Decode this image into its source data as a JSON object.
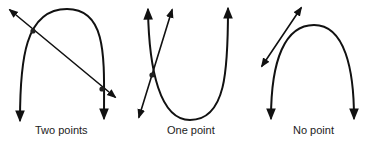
{
  "diagram": {
    "title": "",
    "panels": [
      {
        "id": "two",
        "label": "Two points",
        "intersections": 2
      },
      {
        "id": "one",
        "label": "One point",
        "intersections": 1
      },
      {
        "id": "none",
        "label": "No point",
        "intersections": 0
      }
    ],
    "colors": {
      "stroke": "#111111",
      "background": "#ffffff"
    }
  }
}
